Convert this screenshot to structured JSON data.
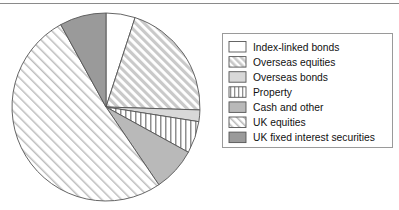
{
  "figure": {
    "title": "",
    "top_rule_color": "#8a8a8a",
    "background": "#ffffff"
  },
  "legend": {
    "border_color": "#9a9a9a",
    "background": "#ffffff",
    "position": "right",
    "items": [
      {
        "label": "Index-linked bonds",
        "swatch_name": "swatch-index-linked-bonds",
        "fill": "#ffffff",
        "pattern": "solid"
      },
      {
        "label": "Overseas equities",
        "swatch_name": "swatch-overseas-equities",
        "fill": "#d4d4d4",
        "pattern": "diagonal-dense"
      },
      {
        "label": "Overseas bonds",
        "swatch_name": "swatch-overseas-bonds",
        "fill": "#d8d8d8",
        "pattern": "solid-light"
      },
      {
        "label": "Property",
        "swatch_name": "swatch-property",
        "fill": "#ffffff",
        "pattern": "vertical"
      },
      {
        "label": "Cash and other",
        "swatch_name": "swatch-cash-and-other",
        "fill": "#b9b9b9",
        "pattern": "solid-medium"
      },
      {
        "label": "UK equities",
        "swatch_name": "swatch-uk-equities",
        "fill": "#f2f2f2",
        "pattern": "diagonal-light"
      },
      {
        "label": "UK fixed interest securities",
        "swatch_name": "swatch-uk-fixed-interest-securities",
        "fill": "#9a9a9a",
        "pattern": "solid-dark"
      }
    ]
  },
  "chart_data": {
    "type": "pie",
    "title": "",
    "xlabel": "",
    "ylabel": "",
    "start_angle_deg": 0,
    "direction": "clockwise",
    "center": {
      "x": 106,
      "y": 107
    },
    "radius": 94,
    "grid": false,
    "legend_position": "right",
    "categories": [
      "Index-linked bonds",
      "Overseas equities",
      "Overseas bonds",
      "Property",
      "Cash and other",
      "UK equities",
      "UK fixed interest securities"
    ],
    "values": [
      5,
      20.5,
      2,
      5.5,
      7.5,
      51.5,
      8
    ],
    "slices": [
      {
        "label": "Index-linked bonds",
        "percent": 5,
        "start_deg": 0,
        "end_deg": 18,
        "fill": "#ffffff",
        "pattern": "solid",
        "outline": "#555555"
      },
      {
        "label": "Overseas equities",
        "percent": 20.5,
        "start_deg": 18,
        "end_deg": 91.8,
        "fill": "#d4d4d4",
        "pattern": "diagonal-dense",
        "outline": "#555555"
      },
      {
        "label": "Overseas bonds",
        "percent": 2,
        "start_deg": 91.8,
        "end_deg": 99,
        "fill": "#d8d8d8",
        "pattern": "solid-light",
        "outline": "#555555"
      },
      {
        "label": "Property",
        "percent": 5.5,
        "start_deg": 99,
        "end_deg": 118.8,
        "fill": "#ffffff",
        "pattern": "vertical",
        "outline": "#555555"
      },
      {
        "label": "Cash and other",
        "percent": 7.5,
        "start_deg": 118.8,
        "end_deg": 145.8,
        "fill": "#b9b9b9",
        "pattern": "solid-medium",
        "outline": "#555555"
      },
      {
        "label": "UK equities",
        "percent": 51.5,
        "start_deg": 145.8,
        "end_deg": 331.2,
        "fill": "#f2f2f2",
        "pattern": "diagonal-light",
        "outline": "#555555"
      },
      {
        "label": "UK fixed interest securities",
        "percent": 8,
        "start_deg": 331.2,
        "end_deg": 360,
        "fill": "#9a9a9a",
        "pattern": "solid-dark",
        "outline": "#555555"
      }
    ]
  }
}
